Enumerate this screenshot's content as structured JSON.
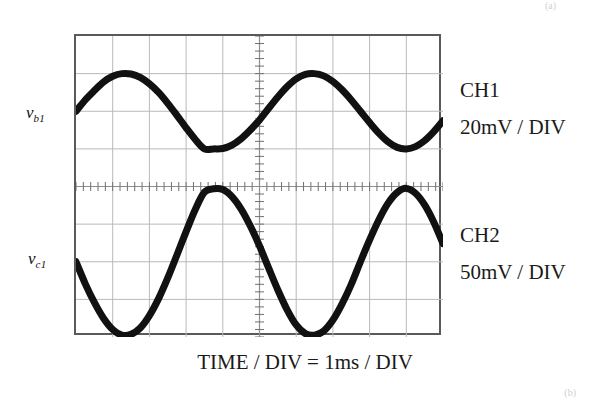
{
  "figure": {
    "type": "oscilloscope-display",
    "timebase_caption": "TIME / DIV = 1ms / DIV"
  },
  "scope": {
    "grid": {
      "x_divisions": 10,
      "y_divisions": 8,
      "left_px": 74,
      "top_px": 34,
      "width_px": 367,
      "height_px": 301,
      "border_color": "#5a5a5a",
      "grid_line_color": "#b9b9b9",
      "axis_color": "#8f8f8f",
      "background": "#ffffff",
      "minor_ticks_per_division": 5
    }
  },
  "channels": [
    {
      "id": "ch1",
      "name": "CH1",
      "scale": "20mV / DIV",
      "signal_label": "v",
      "signal_subscript": "b1",
      "trace_color": "#111111"
    },
    {
      "id": "ch2",
      "name": "CH2",
      "scale": "50mV / DIV",
      "signal_label": "v",
      "signal_subscript": "c1",
      "trace_color": "#111111"
    }
  ],
  "marks": {
    "top_right": "(a)",
    "bottom_right": "(b)"
  },
  "chart_data": {
    "type": "line",
    "title": "",
    "subtitle": "",
    "xlabel": "TIME / DIV = 1ms / DIV",
    "ylabel": "",
    "grid": true,
    "legend_position": "right",
    "x_unit": "ms",
    "x_divisions": 10,
    "y_divisions": 8,
    "xlim": [
      0,
      10
    ],
    "ylim_divisions": [
      -4,
      4
    ],
    "annotations": [
      "CH1 trace centred on +2 divisions above screen centre",
      "CH2 trace centred on -2 divisions below screen centre",
      "CH2 is 180 degrees out of phase with CH1"
    ],
    "series": [
      {
        "name": "CH1",
        "label": "v_b1",
        "volts_per_div": 0.02,
        "volts_per_div_text": "20mV / DIV",
        "waveform": "sine",
        "amplitude_divisions": 1.0,
        "amplitude_mV": 20,
        "peak_to_peak_mV": 40,
        "offset_divisions": 2.0,
        "period_divisions": 5.2,
        "period_ms": 5.2,
        "frequency_hz": 192,
        "phase_degrees": 0,
        "color": "#111111",
        "x": [
          0.0,
          0.25,
          0.5,
          0.75,
          1.0,
          1.25,
          1.5,
          1.75,
          2.0,
          2.25,
          2.5,
          2.75,
          3.0,
          3.25,
          3.5,
          3.75,
          4.0,
          4.25,
          4.5,
          4.75,
          5.0,
          5.25,
          5.5,
          5.75,
          6.0,
          6.25,
          6.5,
          6.75,
          7.0,
          7.25,
          7.5,
          7.75,
          8.0,
          8.25,
          8.5,
          8.75,
          9.0,
          9.25,
          9.5,
          9.75,
          10.0
        ],
        "y_divisions": [
          2.0,
          2.3,
          2.55,
          2.78,
          2.93,
          3.0,
          2.99,
          2.9,
          2.73,
          2.5,
          2.21,
          1.89,
          1.56,
          1.25,
          1.0,
          1.0,
          1.01,
          1.1,
          1.27,
          1.5,
          1.77,
          2.08,
          2.38,
          2.65,
          2.86,
          2.98,
          3.0,
          2.94,
          2.79,
          2.57,
          2.3,
          2.0,
          1.7,
          1.42,
          1.19,
          1.04,
          1.0,
          1.06,
          1.22,
          1.46,
          1.75
        ]
      },
      {
        "name": "CH2",
        "label": "v_c1",
        "volts_per_div": 0.05,
        "volts_per_div_text": "50mV / DIV",
        "waveform": "sine (inverted)",
        "amplitude_divisions": 1.95,
        "amplitude_mV": 97.5,
        "peak_to_peak_mV": 195,
        "offset_divisions": -2.0,
        "period_divisions": 5.2,
        "period_ms": 5.2,
        "frequency_hz": 192,
        "phase_degrees": 180,
        "color": "#111111",
        "x": [
          0.0,
          0.25,
          0.5,
          0.75,
          1.0,
          1.25,
          1.5,
          1.75,
          2.0,
          2.25,
          2.5,
          2.75,
          3.0,
          3.25,
          3.5,
          3.75,
          4.0,
          4.25,
          4.5,
          4.75,
          5.0,
          5.25,
          5.5,
          5.75,
          6.0,
          6.25,
          6.5,
          6.75,
          7.0,
          7.25,
          7.5,
          7.75,
          8.0,
          8.25,
          8.5,
          8.75,
          9.0,
          9.25,
          9.5,
          9.75,
          10.0
        ],
        "y_divisions": [
          -2.0,
          -2.58,
          -3.08,
          -3.5,
          -3.8,
          -3.95,
          -3.93,
          -3.76,
          -3.43,
          -2.98,
          -2.43,
          -1.82,
          -1.2,
          -0.61,
          -0.15,
          -0.06,
          -0.08,
          -0.27,
          -0.6,
          -1.05,
          -1.58,
          -2.17,
          -2.75,
          -3.27,
          -3.68,
          -3.91,
          -3.95,
          -3.84,
          -3.55,
          -3.12,
          -2.6,
          -2.0,
          -1.42,
          -0.89,
          -0.45,
          -0.16,
          -0.05,
          -0.18,
          -0.49,
          -0.95,
          -1.52
        ]
      }
    ]
  }
}
